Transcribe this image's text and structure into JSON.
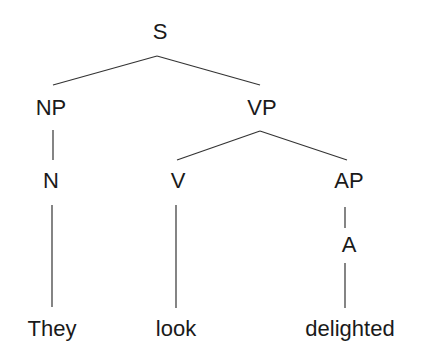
{
  "diagram": {
    "type": "syntax-tree",
    "sentence": "They look delighted",
    "nodes": {
      "s": {
        "label": "S",
        "x": 160,
        "y": 21
      },
      "np": {
        "label": "NP",
        "x": 51,
        "y": 97
      },
      "vp": {
        "label": "VP",
        "x": 262,
        "y": 97
      },
      "n": {
        "label": "N",
        "x": 51,
        "y": 170
      },
      "v": {
        "label": "V",
        "x": 178,
        "y": 170
      },
      "ap": {
        "label": "AP",
        "x": 349,
        "y": 170
      },
      "a": {
        "label": "A",
        "x": 349,
        "y": 234
      },
      "they": {
        "label": "They",
        "x": 52,
        "y": 318
      },
      "look": {
        "label": "look",
        "x": 176,
        "y": 318
      },
      "delighted": {
        "label": "delighted",
        "x": 350,
        "y": 318
      }
    },
    "edges": [
      {
        "from": "S",
        "to": "NP",
        "x1": 157,
        "y1": 56,
        "x2": 53,
        "y2": 85
      },
      {
        "from": "S",
        "to": "VP",
        "x1": 157,
        "y1": 56,
        "x2": 260,
        "y2": 85
      },
      {
        "from": "NP",
        "to": "N",
        "x1": 53,
        "y1": 130,
        "x2": 53,
        "y2": 160
      },
      {
        "from": "VP",
        "to": "V",
        "x1": 260,
        "y1": 131,
        "x2": 177,
        "y2": 160
      },
      {
        "from": "VP",
        "to": "AP",
        "x1": 260,
        "y1": 131,
        "x2": 347,
        "y2": 160
      },
      {
        "from": "N",
        "to": "They",
        "x1": 52,
        "y1": 205,
        "x2": 52,
        "y2": 307
      },
      {
        "from": "V",
        "to": "look",
        "x1": 176,
        "y1": 205,
        "x2": 176,
        "y2": 308
      },
      {
        "from": "AP",
        "to": "A",
        "x1": 345,
        "y1": 207,
        "x2": 345,
        "y2": 228
      },
      {
        "from": "A",
        "to": "delighted",
        "x1": 345,
        "y1": 263,
        "x2": 345,
        "y2": 308
      }
    ],
    "colors": {
      "line": "#333333",
      "text": "#1a1a1a",
      "background": "#ffffff"
    }
  }
}
